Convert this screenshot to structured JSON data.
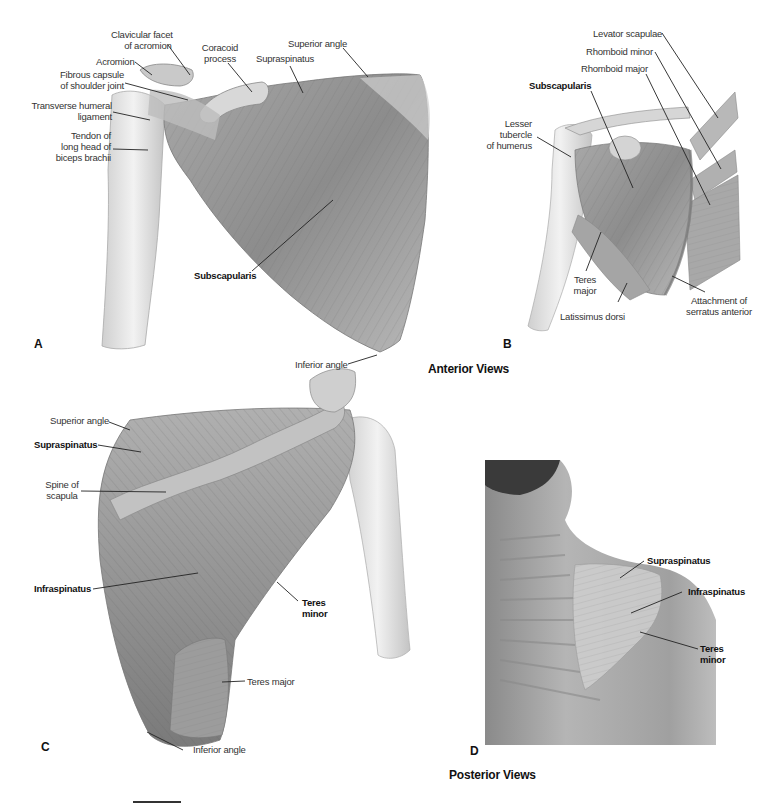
{
  "figure": {
    "panels": [
      {
        "letter": "A",
        "view": "anterior",
        "labels": {
          "clavicular_facet": "Clavicular facet\nof acromion",
          "clavicular_facet_l1": "Clavicular facet",
          "clavicular_facet_l2": "of acromion",
          "acromion": "Acromion",
          "fibrous_capsule_l1": "Fibrous capsule",
          "fibrous_capsule_l2": "of shoulder joint",
          "transverse_humeral_l1": "Transverse humeral",
          "transverse_humeral_l2": "ligament",
          "tendon_biceps_l1": "Tendon of",
          "tendon_biceps_l2": "long head of",
          "tendon_biceps_l3": "biceps brachii",
          "coracoid_l1": "Coracoid",
          "coracoid_l2": "process",
          "supraspinatus": "Supraspinatus",
          "superior_angle": "Superior angle",
          "subscapularis": "Subscapularis",
          "inferior_angle": "Inferior angle"
        }
      },
      {
        "letter": "B",
        "view": "anterior",
        "labels": {
          "levator_scapulae": "Levator scapulae",
          "rhomboid_minor": "Rhomboid minor",
          "rhomboid_major": "Rhomboid major",
          "subscapularis": "Subscapularis",
          "lesser_tubercle_l1": "Lesser",
          "lesser_tubercle_l2": "tubercle",
          "lesser_tubercle_l3": "of humerus",
          "teres_major_l1": "Teres",
          "teres_major_l2": "major",
          "latissimus_dorsi": "Latissimus dorsi",
          "serratus_l1": "Attachment of",
          "serratus_l2": "serratus anterior"
        }
      },
      {
        "letter": "C",
        "view": "posterior",
        "labels": {
          "superior_angle": "Superior angle",
          "supraspinatus": "Supraspinatus",
          "spine_l1": "Spine of",
          "spine_l2": "scapula",
          "infraspinatus": "Infraspinatus",
          "teres_minor_l1": "Teres",
          "teres_minor_l2": "minor",
          "teres_major": "Teres major",
          "inferior_angle": "Inferior angle"
        }
      },
      {
        "letter": "D",
        "view": "posterior",
        "labels": {
          "supraspinatus": "Supraspinatus",
          "infraspinatus": "Infraspinatus",
          "teres_minor_l1": "Teres",
          "teres_minor_l2": "minor"
        }
      }
    ],
    "captions": {
      "anterior": "Anterior Views",
      "posterior": "Posterior Views"
    },
    "colors": {
      "background": "#ffffff",
      "muscle_mid": "#9a9a9a",
      "muscle_dark": "#6e6e6e",
      "bone_light": "#e4e4e4",
      "label_text": "#333333",
      "photo_dark": "#3a3a3a"
    }
  }
}
